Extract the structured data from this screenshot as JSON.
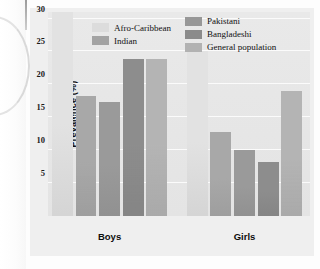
{
  "figure": {
    "name": "prevalence-bar-chart"
  },
  "chart_data": {
    "type": "bar",
    "title": "",
    "xlabel": "",
    "ylabel": "Prevalence (%)",
    "ylim": [
      0,
      31
    ],
    "yticks": [
      5,
      10,
      15,
      20,
      25,
      30
    ],
    "grid": true,
    "legend_position": "top-center",
    "categories": [
      "Boys",
      "Girls"
    ],
    "series": [
      {
        "name": "Afro-Caribbean",
        "color": "#e2e2e2",
        "values": [
          31.0,
          25.0
        ]
      },
      {
        "name": "Indian",
        "color": "#a8a8a8",
        "values": [
          18.3,
          12.7
        ]
      },
      {
        "name": "Pakistani",
        "color": "#9a9a9a",
        "values": [
          17.3,
          10.0
        ]
      },
      {
        "name": "Bangladeshi",
        "color": "#8d8d8d",
        "values": [
          23.9,
          8.2
        ]
      },
      {
        "name": "General population",
        "color": "#b4b4b4",
        "values": [
          23.9,
          19.0
        ]
      }
    ],
    "bar_values_boys": [
      31.0,
      18.3,
      17.3,
      23.9,
      23.9
    ],
    "bar_values_girls": [
      25.0,
      12.7,
      10.0,
      8.2,
      19.0
    ]
  },
  "axis": {
    "y_label": "Prevalence (%)",
    "ticks": [
      "30",
      "25",
      "20",
      "15",
      "10",
      "5"
    ]
  },
  "legend": {
    "left": [
      {
        "label": "Afro-Caribbean",
        "color": "#dcdcdc"
      },
      {
        "label": "Indian",
        "color": "#a3a3a3"
      }
    ],
    "right": [
      {
        "label": "Pakistani",
        "color": "#979797"
      },
      {
        "label": "Bangladeshi",
        "color": "#8b8b8b"
      },
      {
        "label": "General population",
        "color": "#b2b2b2"
      }
    ]
  },
  "groups": [
    {
      "label": "Boys"
    },
    {
      "label": "Girls"
    }
  ]
}
